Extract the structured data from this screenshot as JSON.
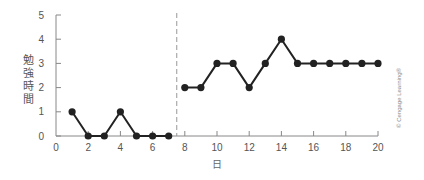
{
  "chart_data": {
    "type": "line",
    "title": "",
    "xlabel": "日",
    "ylabel": "勉強時間",
    "xlim": [
      0,
      20
    ],
    "ylim": [
      0,
      5
    ],
    "x_ticks": [
      0,
      2,
      4,
      6,
      8,
      10,
      12,
      14,
      16,
      18,
      20
    ],
    "y_ticks": [
      0,
      1,
      2,
      3,
      4,
      5
    ],
    "grid": false,
    "phase_divider_x": 7.5,
    "series": [
      {
        "name": "phase-1",
        "x": [
          1,
          2,
          3,
          4,
          5,
          6,
          7
        ],
        "values": [
          1,
          0,
          0,
          1,
          0,
          0,
          0
        ]
      },
      {
        "name": "phase-2",
        "x": [
          8,
          9,
          10,
          11,
          12,
          13,
          14,
          15,
          16,
          17,
          18,
          19,
          20
        ],
        "values": [
          2,
          2,
          3,
          3,
          2,
          3,
          4,
          3,
          3,
          3,
          3,
          3,
          3
        ]
      }
    ],
    "annotations": [
      "© Cengage Learning®"
    ]
  },
  "colors": {
    "line": "#222222",
    "axis": "#888888",
    "divider": "#999999",
    "text": "#555555"
  },
  "labels": {
    "ylabel_chars": [
      "勉",
      "強",
      "時",
      "間"
    ],
    "xlabel": "日",
    "credit": "© Cengage Learning®"
  }
}
